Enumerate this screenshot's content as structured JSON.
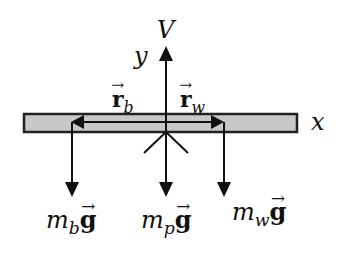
{
  "diagram": {
    "type": "free-body-diagram",
    "colors": {
      "line": "#111111",
      "bar_fill": "#c8c8c8",
      "bar_stroke": "#222222",
      "background": "#ffffff"
    },
    "axes": {
      "x_label": "x",
      "y_label": "y"
    },
    "upward_force": {
      "label": "V"
    },
    "position_vectors": [
      {
        "symbol": "r",
        "subscript": "b",
        "direction": "left"
      },
      {
        "symbol": "r",
        "subscript": "w",
        "direction": "right"
      }
    ],
    "weight_forces": [
      {
        "mass": "m",
        "subscript": "b",
        "gravity": "g"
      },
      {
        "mass": "m",
        "subscript": "p",
        "gravity": "g"
      },
      {
        "mass": "m",
        "subscript": "w",
        "gravity": "g"
      }
    ]
  }
}
